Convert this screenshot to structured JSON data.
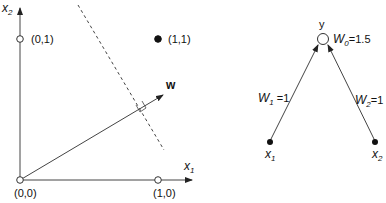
{
  "plot": {
    "axis_x_label": "x",
    "axis_x_sub": "1",
    "axis_y_label": "x",
    "axis_y_sub": "2",
    "points": [
      {
        "label": "(0,0)",
        "filled": false
      },
      {
        "label": "(1,0)",
        "filled": false
      },
      {
        "label": "(0,1)",
        "filled": false
      },
      {
        "label": "(1,1)",
        "filled": true
      }
    ],
    "weight_vector_label": "w",
    "decision_boundary": "dashed"
  },
  "network": {
    "output_label": "y",
    "bias_label": "W",
    "bias_sub": "0",
    "bias_value": "=1.5",
    "input1_label": "x",
    "input1_sub": "1",
    "input2_label": "x",
    "input2_sub": "2",
    "weight1_label": "W",
    "weight1_sub": "1",
    "weight1_value": " =1",
    "weight2_label": "W",
    "weight2_sub": "2",
    "weight2_value": "=1"
  },
  "colors": {
    "stroke": "#333333",
    "text": "#111111"
  }
}
